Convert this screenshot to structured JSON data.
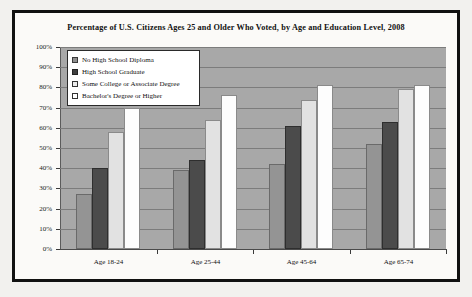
{
  "chart_data": {
    "type": "bar",
    "title": "Percentage of U.S. Citizens Ages 25 and Older Who Voted, by Age and Education Level, 2008",
    "xlabel": "",
    "ylabel": "",
    "ylim": [
      0,
      100
    ],
    "grid": true,
    "legend_position": "top-left-inside",
    "categories": [
      "Age 18-24",
      "Age 25-44",
      "Age 45-64",
      "Age 65-74"
    ],
    "ytick_labels": [
      "100%",
      "90%",
      "80%",
      "70%",
      "60%",
      "50%",
      "40%",
      "30%",
      "20%",
      "10%",
      "0%"
    ],
    "ytick_values": [
      100,
      90,
      80,
      70,
      60,
      50,
      40,
      30,
      20,
      10,
      0
    ],
    "series": [
      {
        "name": "No High School Diploma",
        "swatch": "s0",
        "color": "#949494",
        "values": [
          27,
          39,
          42,
          52
        ]
      },
      {
        "name": "High School Graduate",
        "swatch": "s1",
        "color": "#4b4b4b",
        "values": [
          40,
          44,
          61,
          63
        ]
      },
      {
        "name": "Some College or Associate Degree",
        "swatch": "s2",
        "color": "#e2e2e2",
        "values": [
          58,
          64,
          74,
          79
        ]
      },
      {
        "name": "Bachelor's Degree or Higher",
        "swatch": "s3",
        "color": "#fdfdfd",
        "values": [
          70,
          76,
          81,
          81
        ]
      }
    ]
  }
}
